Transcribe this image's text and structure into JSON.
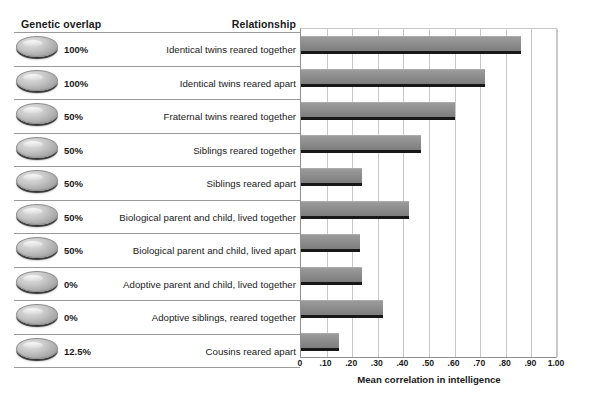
{
  "table": {
    "header_overlap": "Genetic overlap",
    "header_relationship": "Relationship",
    "rows": [
      {
        "overlap": "100%",
        "relationship": "Identical twins reared together"
      },
      {
        "overlap": "100%",
        "relationship": "Identical twins reared apart"
      },
      {
        "overlap": "50%",
        "relationship": "Fraternal twins reared together"
      },
      {
        "overlap": "50%",
        "relationship": "Siblings reared together"
      },
      {
        "overlap": "50%",
        "relationship": "Siblings reared apart"
      },
      {
        "overlap": "50%",
        "relationship": "Biological parent and child, lived together"
      },
      {
        "overlap": "50%",
        "relationship": "Biological parent and child, lived apart"
      },
      {
        "overlap": "0%",
        "relationship": "Adoptive parent and child, lived together"
      },
      {
        "overlap": "0%",
        "relationship": "Adoptive siblings, reared together"
      },
      {
        "overlap": "12.5%",
        "relationship": "Cousins reared apart"
      }
    ]
  },
  "chart_data": {
    "type": "bar",
    "orientation": "horizontal",
    "title": "",
    "xlabel": "Mean correlation in intelligence",
    "ylabel": "",
    "xlim": [
      0,
      1.0
    ],
    "grid": true,
    "legend": false,
    "tick_labels": [
      "0",
      ".10",
      ".20",
      ".30",
      ".40",
      ".50",
      ".60",
      ".70",
      ".80",
      ".90",
      "1.00"
    ],
    "tick_values": [
      0,
      0.1,
      0.2,
      0.3,
      0.4,
      0.5,
      0.6,
      0.7,
      0.8,
      0.9,
      1.0
    ],
    "categories": [
      "Identical twins reared together",
      "Identical twins reared apart",
      "Fraternal twins reared together",
      "Siblings reared together",
      "Siblings reared apart",
      "Biological parent and child, lived together",
      "Biological parent and child, lived apart",
      "Adoptive parent and child, lived together",
      "Adoptive siblings, reared together",
      "Cousins reared apart"
    ],
    "values": [
      0.86,
      0.72,
      0.6,
      0.47,
      0.24,
      0.42,
      0.23,
      0.24,
      0.32,
      0.15
    ],
    "bar_color": "#8e8e8e"
  }
}
